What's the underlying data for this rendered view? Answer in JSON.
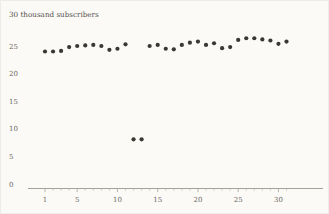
{
  "figure": {
    "background_color": "#fbfaf7",
    "border_color": "#ececea",
    "dot_color": "#3b3733",
    "axis_color": "#9a958e",
    "text_color": "#55514c"
  },
  "chart_data": {
    "type": "scatter",
    "title": "30 thousand subscribers",
    "ylabel": "30 thousand subscribers",
    "xlabel": "",
    "grid": false,
    "legend": null,
    "xlim": [
      0,
      32
    ],
    "ylim": [
      0,
      30
    ],
    "ytick_labels": [
      "0",
      "5",
      "10",
      "15",
      "20",
      "25"
    ],
    "ytick_values": [
      0,
      5,
      10,
      15,
      20,
      25
    ],
    "xtick_labels": [
      "1",
      "5",
      "10",
      "15",
      "20",
      "25",
      "30"
    ],
    "xtick_values": [
      1,
      5,
      10,
      15,
      20,
      25,
      30
    ],
    "x_minor_ticks_every": 1,
    "x": [
      1,
      2,
      3,
      4,
      5,
      6,
      7,
      8,
      9,
      10,
      11,
      12,
      13,
      14,
      15,
      16,
      17,
      18,
      19,
      20,
      21,
      22,
      23,
      24,
      25,
      26,
      27,
      28,
      29,
      30,
      31
    ],
    "values": [
      24.0,
      24.0,
      24.1,
      24.8,
      25.0,
      25.1,
      25.2,
      25.0,
      24.3,
      24.5,
      25.3,
      8.1,
      8.1,
      25.0,
      25.2,
      24.5,
      24.4,
      25.2,
      25.6,
      25.8,
      25.2,
      25.5,
      24.6,
      24.8,
      26.1,
      26.4,
      26.4,
      26.2,
      26.0,
      25.4,
      25.8
    ],
    "series": [
      {
        "name": "subscribers",
        "values": [
          24.0,
          24.0,
          24.1,
          24.8,
          25.0,
          25.1,
          25.2,
          25.0,
          24.3,
          24.5,
          25.3,
          8.1,
          8.1,
          25.0,
          25.2,
          24.5,
          24.4,
          25.2,
          25.6,
          25.8,
          25.2,
          25.5,
          24.6,
          24.8,
          26.1,
          26.4,
          26.4,
          26.2,
          26.0,
          25.4,
          25.8
        ]
      }
    ]
  }
}
